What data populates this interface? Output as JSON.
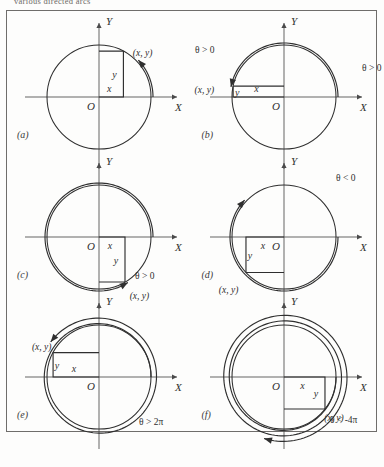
{
  "caption": "various directed arcs",
  "figure": {
    "axis_labels": {
      "x": "X",
      "y": "Y",
      "origin": "O"
    },
    "point_label": "(x, y)",
    "leg_x_label": "x",
    "leg_y_label": "y",
    "panels": [
      {
        "id": "a",
        "label": "(a)",
        "theta_label": "θ > 0",
        "quadrant": 1,
        "direction": "counterclockwise",
        "revolutions": 0.12,
        "angle_deg": 62,
        "theta_pos": {
          "x": 96,
          "y": 44
        },
        "point_pos": {
          "x": 64,
          "y": 16
        }
      },
      {
        "id": "b",
        "label": "(b)",
        "theta_label": "θ > 0",
        "quadrant": 2,
        "direction": "counterclockwise",
        "revolutions": 0.47,
        "angle_deg": 168,
        "theta_pos": {
          "x": 78,
          "y": 26
        },
        "point_pos": {
          "x": -96,
          "y": 22
        }
      },
      {
        "id": "c",
        "label": "(c)",
        "theta_label": "θ > 0",
        "quadrant": 4,
        "direction": "counterclockwise",
        "revolutions": 0.84,
        "angle_deg": 300,
        "theta_pos": {
          "x": 36,
          "y": -42
        },
        "point_pos": {
          "x": 48,
          "y": 56
        }
      },
      {
        "id": "d",
        "label": "(d)",
        "theta_label": "θ < 0",
        "quadrant": 3,
        "direction": "clockwise",
        "revolutions": 0.62,
        "angle_deg": 223,
        "theta_pos": {
          "x": 52,
          "y": 56
        },
        "point_pos": {
          "x": -58,
          "y": 70
        }
      },
      {
        "id": "e",
        "label": "(e)",
        "theta_label": "θ > 2π",
        "quadrant": 2,
        "direction": "counterclockwise",
        "revolutions": 1.4,
        "angle_deg": 152,
        "theta_pos": {
          "x": 40,
          "y": -48
        },
        "point_pos": {
          "x": -38,
          "y": -10
        }
      },
      {
        "id": "f",
        "label": "(f)",
        "theta_label": "θ < -4π",
        "quadrant": 4,
        "direction": "clockwise",
        "revolutions": 2.3,
        "angle_deg": 322,
        "theta_pos": {
          "x": 46,
          "y": -46
        },
        "point_pos": {
          "x": 30,
          "y": 40
        }
      }
    ]
  },
  "colors": {
    "ink": "#2f2f2f",
    "frame": "#6f6d6b",
    "paper": "#fdfdfc",
    "caption": "#6d6a66"
  }
}
